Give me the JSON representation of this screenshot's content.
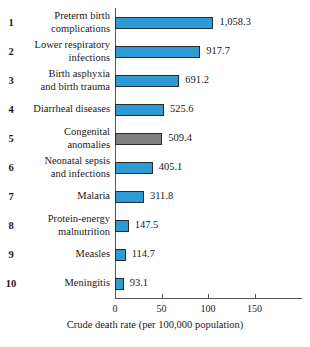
{
  "chart_data": {
    "type": "bar",
    "orientation": "horizontal",
    "title": "",
    "xlabel": "Crude death rate (per 100,000 population)",
    "ylabel": "",
    "xlim": [
      0,
      185
    ],
    "xticks": [
      0,
      50,
      100,
      150
    ],
    "xtick_labels": [
      "0",
      "50",
      "100",
      "150"
    ],
    "grid": false,
    "legend": false,
    "value_scale_note": "Axis units are tens; data labels show actual rate",
    "categories": [
      "Preterm birth complications",
      "Lower respiratory infections",
      "Birth asphyxia and birth trauma",
      "Diarrheal diseases",
      "Congenital anomalies",
      "Neonatal sepsis and infections",
      "Malaria",
      "Protein-energy malnutrition",
      "Measles",
      "Meningitis"
    ],
    "values": [
      1058.3,
      917.7,
      691.2,
      525.6,
      509.4,
      405.1,
      311.8,
      147.5,
      114.7,
      93.1
    ],
    "value_labels": [
      "1,058.3",
      "917.7",
      "691.2",
      "525.6",
      "509.4",
      "405.1",
      "311.8",
      "147.5",
      "114.7",
      "93.1"
    ],
    "ranks": [
      "1",
      "2",
      "3",
      "4",
      "5",
      "6",
      "7",
      "8",
      "9",
      "10"
    ],
    "bar_colors": [
      "blue",
      "blue",
      "blue",
      "blue",
      "gray",
      "blue",
      "blue",
      "blue",
      "blue",
      "blue"
    ],
    "colors": {
      "blue": "#2e9bd6",
      "gray": "#808080",
      "bar_border": "#2a2a2a",
      "axis": "#555555",
      "background": "#ffffff",
      "text": "#1a1a1a"
    }
  },
  "rows": [
    {
      "rank": "1",
      "label_lines": [
        "Preterm birth",
        "complications"
      ],
      "value_label": "1,058.3",
      "value": 1058.3,
      "color": "blue"
    },
    {
      "rank": "2",
      "label_lines": [
        "Lower respiratory",
        "infections"
      ],
      "value_label": "917.7",
      "value": 917.7,
      "color": "blue"
    },
    {
      "rank": "3",
      "label_lines": [
        "Birth asphyxia",
        "and birth trauma"
      ],
      "value_label": "691.2",
      "value": 691.2,
      "color": "blue"
    },
    {
      "rank": "4",
      "label_lines": [
        "Diarrheal diseases"
      ],
      "value_label": "525.6",
      "value": 525.6,
      "color": "blue"
    },
    {
      "rank": "5",
      "label_lines": [
        "Congenital",
        "anomalies"
      ],
      "value_label": "509.4",
      "value": 509.4,
      "color": "gray"
    },
    {
      "rank": "6",
      "label_lines": [
        "Neonatal sepsis",
        "and infections"
      ],
      "value_label": "405.1",
      "value": 405.1,
      "color": "blue"
    },
    {
      "rank": "7",
      "label_lines": [
        "Malaria"
      ],
      "value_label": "311.8",
      "value": 311.8,
      "color": "blue"
    },
    {
      "rank": "8",
      "label_lines": [
        "Protein-energy",
        "malnutrition"
      ],
      "value_label": "147.5",
      "value": 147.5,
      "color": "blue"
    },
    {
      "rank": "9",
      "label_lines": [
        "Measles"
      ],
      "value_label": "114.7",
      "value": 114.7,
      "color": "blue"
    },
    {
      "rank": "10",
      "label_lines": [
        "Meningitis"
      ],
      "value_label": "93.1",
      "value": 93.1,
      "color": "blue"
    }
  ],
  "axis": {
    "title": "Crude death rate (per 100,000 population)",
    "ticks": [
      "0",
      "50",
      "100",
      "150"
    ]
  }
}
